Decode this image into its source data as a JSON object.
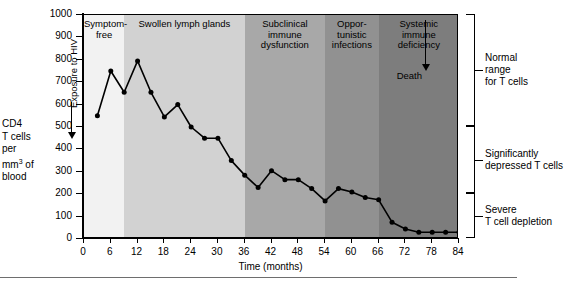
{
  "chart_data": {
    "type": "line",
    "title": "",
    "xlabel": "Time (months)",
    "ylabel": "CD4 T cells per mm3 of blood",
    "xlim": [
      0,
      84
    ],
    "ylim": [
      0,
      1000
    ],
    "xticks": [
      0,
      6,
      12,
      18,
      24,
      30,
      36,
      42,
      48,
      54,
      60,
      66,
      72,
      78,
      84
    ],
    "yticks": [
      0,
      100,
      200,
      300,
      400,
      500,
      600,
      700,
      800,
      900,
      1000
    ],
    "grid": false,
    "legend": "none",
    "series": [
      {
        "name": "CD4 T cell count",
        "marker": "filled-circle",
        "color": "#000000",
        "points": [
          {
            "x": 3,
            "y": 550
          },
          {
            "x": 6,
            "y": 750
          },
          {
            "x": 9,
            "y": 655
          },
          {
            "x": 12,
            "y": 795
          },
          {
            "x": 15,
            "y": 655
          },
          {
            "x": 18,
            "y": 545
          },
          {
            "x": 21,
            "y": 600
          },
          {
            "x": 24,
            "y": 500
          },
          {
            "x": 27,
            "y": 450
          },
          {
            "x": 30,
            "y": 450
          },
          {
            "x": 33,
            "y": 350
          },
          {
            "x": 36,
            "y": 285
          },
          {
            "x": 39,
            "y": 230
          },
          {
            "x": 42,
            "y": 305
          },
          {
            "x": 45,
            "y": 265
          },
          {
            "x": 48,
            "y": 265
          },
          {
            "x": 51,
            "y": 225
          },
          {
            "x": 54,
            "y": 170
          },
          {
            "x": 57,
            "y": 225
          },
          {
            "x": 60,
            "y": 210
          },
          {
            "x": 63,
            "y": 185
          },
          {
            "x": 66,
            "y": 175
          },
          {
            "x": 69,
            "y": 75
          },
          {
            "x": 72,
            "y": 45
          },
          {
            "x": 75,
            "y": 30
          },
          {
            "x": 78,
            "y": 30
          },
          {
            "x": 81,
            "y": 30
          },
          {
            "x": 84,
            "y": 30
          }
        ]
      }
    ],
    "phase_bands": [
      {
        "name": "symptom-free",
        "label": "Symptom-\nfree",
        "x_start": 0,
        "x_end": 9,
        "color": "#f2f2f2"
      },
      {
        "name": "swollen-lymph-glands",
        "label": "Swollen lymph glands",
        "x_start": 9,
        "x_end": 36,
        "color": "#d2d2d2"
      },
      {
        "name": "subclinical-immune-dysfunction",
        "label": "Subclinical immune\ndysfunction",
        "x_start": 36,
        "x_end": 54,
        "color": "#a8a8a8"
      },
      {
        "name": "opportunistic-infections",
        "label": "Oppor-\ntunistic\ninfections",
        "x_start": 54,
        "x_end": 66,
        "color": "#919191"
      },
      {
        "name": "systemic-immune-deficiency",
        "label": "Systemic\nimmune\ndeficiency",
        "x_start": 66,
        "x_end": 84,
        "color": "#7d7d7d"
      }
    ],
    "annotations": [
      {
        "name": "exposure-to-hiv",
        "text": "Exposure to HIV",
        "x": 3,
        "orientation": "vertical"
      },
      {
        "name": "death",
        "text": "Death",
        "x": 80,
        "orientation": "horizontal"
      }
    ],
    "range_brackets": [
      {
        "name": "normal-range",
        "label": "Normal\nrange\nfor T cells",
        "y_start": 500,
        "y_end": 1000
      },
      {
        "name": "significantly-depressed",
        "label": "Significantly\ndepressed T cells",
        "y_start": 200,
        "y_end": 500
      },
      {
        "name": "severe-t-cell-depletion",
        "label": "Severe\nT cell depletion",
        "y_start": 0,
        "y_end": 200
      }
    ]
  },
  "axes": {
    "y_title_lines": [
      "CD4",
      "T cells",
      "per",
      "mm",
      " of",
      "blood"
    ],
    "y_title_sup": "3",
    "x_title": "Time (months)"
  }
}
